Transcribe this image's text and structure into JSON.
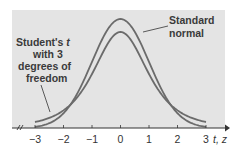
{
  "chart_data": {
    "type": "line",
    "title": "",
    "xlabel": "t, z",
    "ylabel": "",
    "xlim": [
      -3,
      3
    ],
    "x_ticks": [
      "-3",
      "-2",
      "-1",
      "0",
      "1",
      "2",
      "3"
    ],
    "grid": false,
    "legend_position": "inline annotations",
    "series": [
      {
        "name": "Standard normal",
        "distribution": "N(0,1)",
        "x": [
          -3,
          -2.5,
          -2,
          -1.5,
          -1,
          -0.5,
          0,
          0.5,
          1,
          1.5,
          2,
          2.5,
          3
        ],
        "values": [
          0.0044,
          0.0175,
          0.054,
          0.1295,
          0.242,
          0.3521,
          0.3989,
          0.3521,
          0.242,
          0.1295,
          0.054,
          0.0175,
          0.0044
        ]
      },
      {
        "name": "Student's t with 3 degrees of freedom",
        "distribution": "t(3)",
        "x": [
          -3,
          -2.5,
          -2,
          -1.5,
          -1,
          -0.5,
          0,
          0.5,
          1,
          1.5,
          2,
          2.5,
          3
        ],
        "values": [
          0.0229,
          0.0422,
          0.0675,
          0.1274,
          0.2067,
          0.3074,
          0.3676,
          0.3074,
          0.2067,
          0.1274,
          0.0675,
          0.0422,
          0.0229
        ]
      }
    ],
    "annotations": [
      {
        "text": "Standard normal",
        "points_to": "Standard normal curve"
      },
      {
        "text": "Student's t with 3 degrees of freedom",
        "points_to": "t curve left tail"
      }
    ]
  },
  "labels": {
    "normal_line1": "Standard",
    "normal_line2": "normal",
    "t_line1": "Student's ",
    "t_var": "t",
    "t_line2": "with 3",
    "t_line3": "degrees of",
    "t_line4": "freedom",
    "axis_var": "t, z"
  },
  "colors": {
    "panel_bg": "#e4e4e4",
    "curve": "#6b6b6b",
    "axis": "#333333"
  }
}
